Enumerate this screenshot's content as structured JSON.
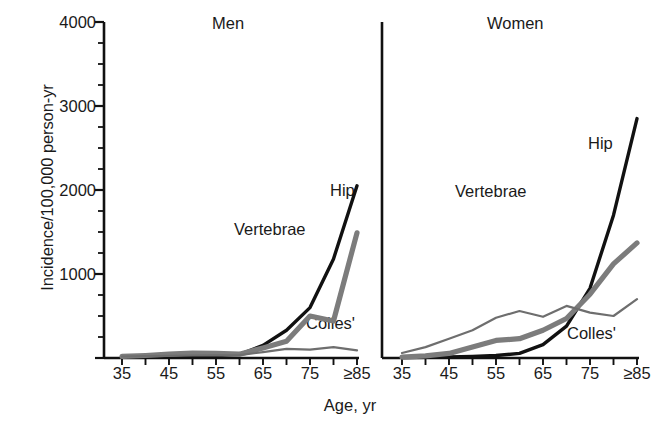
{
  "chart_data": {
    "type": "line",
    "title": "",
    "xlabel": "Age, yr",
    "ylabel": "Incidence/100,000 person-yr",
    "ylim": [
      0,
      4000
    ],
    "ytick_values": [
      0,
      1000,
      2000,
      3000,
      4000
    ],
    "ytick_labels": [
      "",
      "1000",
      "2000",
      "3000",
      "4000"
    ],
    "yminor_step": 250,
    "grid": false,
    "legend_position": "inline-annotations",
    "x": [
      35,
      40,
      45,
      50,
      55,
      60,
      65,
      70,
      75,
      80,
      85
    ],
    "xtick_values": [
      35,
      40,
      45,
      50,
      55,
      60,
      65,
      70,
      75,
      80,
      85
    ],
    "xtick_labels": [
      "35",
      "",
      "45",
      "",
      "55",
      "",
      "65",
      "",
      "75",
      "",
      "≥85"
    ],
    "panels": [
      {
        "name": "Men",
        "title": "Men",
        "series": [
          {
            "name": "Hip",
            "label": "Hip",
            "color": "#111111",
            "width": 3.4,
            "values": [
              10,
              12,
              15,
              20,
              28,
              40,
              150,
              330,
              600,
              1180,
              2050
            ]
          },
          {
            "name": "Vertebrae",
            "label": "Vertebrae",
            "color": "#7c7c7c",
            "width": 5.2,
            "values": [
              20,
              30,
              45,
              60,
              55,
              45,
              120,
              200,
              500,
              440,
              1490
            ]
          },
          {
            "name": "Colles'",
            "label": "Colles'",
            "color": "#6e6e6e",
            "width": 2.2,
            "values": [
              18,
              22,
              26,
              30,
              32,
              34,
              70,
              110,
              100,
              130,
              90
            ]
          }
        ],
        "annotations": [
          {
            "label": "Hip",
            "x": 330,
            "y": 189
          },
          {
            "label": "Vertebrae",
            "x": 234,
            "y": 228
          },
          {
            "label": "Colles'",
            "x": 306,
            "y": 322
          }
        ]
      },
      {
        "name": "Women",
        "title": "Women",
        "series": [
          {
            "name": "Hip",
            "label": "Hip",
            "color": "#111111",
            "width": 3.4,
            "values": [
              5,
              8,
              12,
              18,
              30,
              55,
              160,
              380,
              830,
              1700,
              2850
            ]
          },
          {
            "name": "Vertebrae",
            "label": "Vertebrae",
            "color": "#7c7c7c",
            "width": 5.2,
            "values": [
              10,
              25,
              55,
              130,
              210,
              230,
              330,
              470,
              760,
              1120,
              1370
            ]
          },
          {
            "name": "Colles'",
            "label": "Colles'",
            "color": "#6e6e6e",
            "width": 2.2,
            "values": [
              60,
              130,
              230,
              330,
              480,
              560,
              490,
              620,
              540,
              500,
              700
            ]
          }
        ],
        "annotations": [
          {
            "label": "Hip",
            "x": 588,
            "y": 142
          },
          {
            "label": "Vertebrae",
            "x": 455,
            "y": 190
          },
          {
            "label": "Colles'",
            "x": 567,
            "y": 332
          }
        ]
      }
    ]
  },
  "axis": {
    "y_title": "Incidence/100,000 person-yr",
    "x_title": "Age, yr",
    "y_labels": [
      "4000",
      "3000",
      "2000",
      "1000"
    ],
    "x_labels_men": [
      "35",
      "45",
      "55",
      "65",
      "75",
      "≥85"
    ],
    "x_labels_women": [
      "35",
      "45",
      "55",
      "65",
      "75",
      "≥85"
    ]
  },
  "panel_titles": {
    "left": "Men",
    "right": "Women"
  },
  "colors": {
    "hip": "#111111",
    "vertebrae": "#7c7c7c",
    "colles": "#6e6e6e",
    "axis": "#111111",
    "background": "#ffffff"
  }
}
